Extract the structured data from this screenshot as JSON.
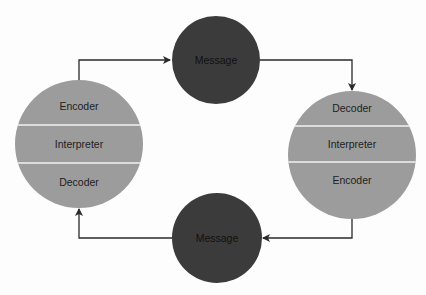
{
  "diagram": {
    "type": "communication-cycle",
    "colors": {
      "participant_fill": "#9c9c9c",
      "message_fill": "#3b3b3b",
      "divider": "#f2f2f2",
      "connector": "#2a2a2a",
      "background": "#fdfdfd"
    },
    "left_participant": {
      "sections": [
        "Encoder",
        "Interpreter",
        "Decoder"
      ]
    },
    "right_participant": {
      "sections": [
        "Decoder",
        "Interpreter",
        "Encoder"
      ]
    },
    "top_message": {
      "label": "Message"
    },
    "bottom_message": {
      "label": "Message"
    },
    "flows": [
      {
        "from": "left_participant",
        "to": "top_message"
      },
      {
        "from": "top_message",
        "to": "right_participant"
      },
      {
        "from": "right_participant",
        "to": "bottom_message"
      },
      {
        "from": "bottom_message",
        "to": "left_participant"
      }
    ]
  }
}
